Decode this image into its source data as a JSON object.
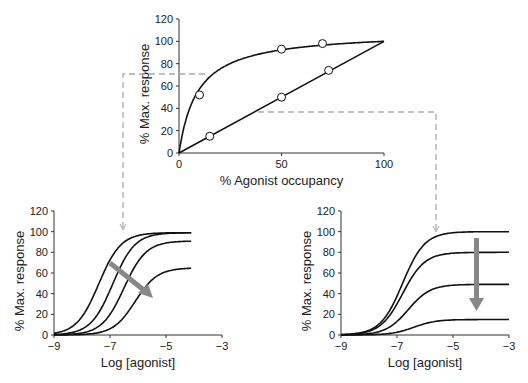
{
  "chart_data": [
    {
      "type": "scatter",
      "title": "",
      "xlabel": "% Agonist occupancy",
      "ylabel": "% Max. response",
      "xlim": [
        0,
        100
      ],
      "ylim": [
        0,
        120
      ],
      "xticks": [
        "0",
        "50",
        "100"
      ],
      "yticks": [
        "0",
        "20",
        "40",
        "60",
        "80",
        "100",
        "120"
      ],
      "series": [
        {
          "name": "hyperbolic (efficient coupling)",
          "points": [
            [
              10,
              52
            ],
            [
              50,
              93
            ],
            [
              70,
              98
            ]
          ],
          "curve_end": [
            100,
            100
          ]
        },
        {
          "name": "linear",
          "points": [
            [
              15,
              15
            ],
            [
              50,
              50
            ],
            [
              73,
              74
            ]
          ],
          "curve_end": [
            100,
            100
          ]
        }
      ],
      "annotations": [
        "dashed line at ~70% response leads to left panel",
        "dashed line at ~37% response leads to right panel"
      ]
    },
    {
      "type": "line",
      "xlabel": "Log [agonist]",
      "ylabel": "% Max. response",
      "xlim": [
        -9,
        -3
      ],
      "ylim": [
        0,
        120
      ],
      "xticks": [
        "-9",
        "-7",
        "-5",
        "-3"
      ],
      "yticks": [
        "0",
        "20",
        "40",
        "60",
        "80",
        "100",
        "120"
      ],
      "series": [
        {
          "name": "curve 1",
          "max": 99,
          "log_ec50": -7.4
        },
        {
          "name": "curve 2",
          "max": 99,
          "log_ec50": -6.9
        },
        {
          "name": "curve 3",
          "max": 91,
          "log_ec50": -6.5
        },
        {
          "name": "curve 4",
          "max": 65,
          "log_ec50": -6.1
        }
      ],
      "annotations": [
        "grey arrow pointing down-right (rightward shift then depression)"
      ]
    },
    {
      "type": "line",
      "xlabel": "Log [agonist]",
      "ylabel": "% Max. response",
      "xlim": [
        -9,
        -3
      ],
      "ylim": [
        0,
        120
      ],
      "xticks": [
        "-9",
        "-7",
        "-5",
        "-3"
      ],
      "yticks": [
        "0",
        "20",
        "40",
        "60",
        "80",
        "100",
        "120"
      ],
      "series": [
        {
          "name": "curve 1",
          "max": 100,
          "log_ec50": -6.8
        },
        {
          "name": "curve 2",
          "max": 80,
          "log_ec50": -6.8
        },
        {
          "name": "curve 3",
          "max": 49,
          "log_ec50": -6.6
        },
        {
          "name": "curve 4",
          "max": 15,
          "log_ec50": -6.4
        }
      ],
      "annotations": [
        "grey arrow pointing down (depression of maximum)"
      ]
    }
  ]
}
